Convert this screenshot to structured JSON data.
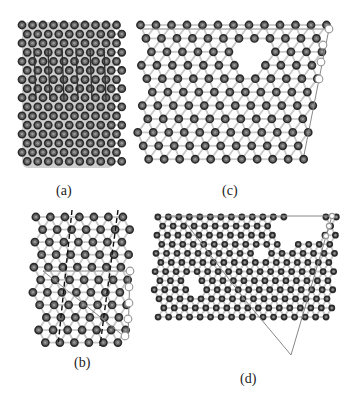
{
  "figure": {
    "panels": [
      {
        "id": "a",
        "label": "(a)",
        "label_pos": [
          56,
          183
        ],
        "description": "nanotube-structure"
      },
      {
        "id": "c",
        "label": "(c)",
        "label_pos": [
          222,
          183
        ],
        "description": "unrolled-lattice-with-vacancy"
      },
      {
        "id": "b",
        "label": "(b)",
        "label_pos": [
          74,
          355
        ],
        "description": "lattice-with-dashed-lines"
      },
      {
        "id": "d",
        "label": "(d)",
        "label_pos": [
          240,
          371
        ],
        "description": "large-lattice-with-vacancies"
      }
    ]
  },
  "colors": {
    "atom_stroke": "#2a2a2a",
    "atom_fill": "#6a6a6a",
    "atom_core": "#9a9a9a",
    "bond": "#c8c8c8",
    "line": "#888888",
    "open_circle": "#9a9a9a",
    "tube_fill": "#bdbdbd"
  },
  "lattices": {
    "a": {
      "x0": 22,
      "y0": 22,
      "x1": 114,
      "y1": 168,
      "spacing": 10.5,
      "r": 3.6
    },
    "c": {
      "x0": 141,
      "y0": 22,
      "x1": 318,
      "y1": 172,
      "spacing": 15.5,
      "r": 3.6,
      "skew": -0.17,
      "vacancies": [
        [
          250,
          55,
          14
        ]
      ]
    },
    "b": {
      "x0": 36,
      "y0": 214,
      "x1": 122,
      "y1": 348,
      "spacing": 14.5,
      "r": 3.6,
      "skew": -0.04
    },
    "d": {
      "x0": 158,
      "y0": 214,
      "x1": 330,
      "y1": 318,
      "spacing": 10.5,
      "r": 2.6,
      "skew": -0.05,
      "vacancies": [
        [
          194,
          283,
          8
        ],
        [
          262,
          254,
          8
        ],
        [
          290,
          232,
          14
        ],
        [
          298,
          222,
          14
        ],
        [
          310,
          226,
          12
        ],
        [
          282,
          228,
          10
        ]
      ]
    }
  },
  "overlays": {
    "c_lines": [
      [
        143,
        29,
        329,
        29
      ],
      [
        329,
        29,
        304,
        155
      ]
    ],
    "c_open": [
      [
        329,
        29
      ],
      [
        323,
        45
      ],
      [
        321,
        62
      ],
      [
        319,
        79
      ]
    ],
    "b_lines": [
      [
        43,
        271,
        130,
        271
      ],
      [
        130,
        271,
        128,
        337
      ],
      [
        43,
        271,
        125,
        337
      ]
    ],
    "b_dashed": [
      [
        72,
        210,
        58,
        346
      ],
      [
        118,
        210,
        100,
        346
      ]
    ],
    "b_open": [
      [
        130,
        271
      ],
      [
        129,
        287
      ],
      [
        129,
        303
      ],
      [
        128,
        319
      ],
      [
        125,
        336
      ]
    ],
    "d_lines": [
      [
        165,
        216,
        332,
        216
      ],
      [
        332,
        216,
        291,
        355
      ],
      [
        245,
        300,
        291,
        355
      ],
      [
        185,
        222,
        245,
        300
      ]
    ],
    "d_open": [
      [
        332,
        216
      ],
      [
        329,
        226
      ],
      [
        326,
        236
      ]
    ]
  }
}
